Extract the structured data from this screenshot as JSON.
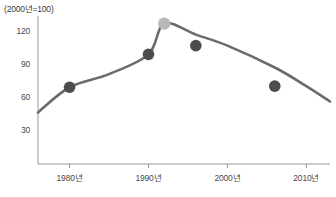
{
  "chart_data": {
    "type": "line",
    "title": "",
    "note": "(2000년=100)",
    "xlabel": "",
    "ylabel": "",
    "xlim": [
      1976,
      2013
    ],
    "ylim": [
      0,
      135
    ],
    "grid": false,
    "legend": false,
    "yticks": [
      30,
      60,
      90,
      120
    ],
    "ytick_labels": [
      "30",
      "60",
      "90",
      "120"
    ],
    "xticks": [
      1980,
      1990,
      2000,
      2010
    ],
    "xtick_labels": [
      "1980년",
      "1990년",
      "2000년",
      "2010년"
    ],
    "series": [
      {
        "name": "지수",
        "color": "#6b6b6b",
        "x": [
          1976,
          1980,
          1985,
          1990,
          1992,
          1996,
          2000,
          2006,
          2010,
          2013
        ],
        "values": [
          47,
          70,
          82,
          100,
          128,
          118,
          108,
          88,
          71,
          57
        ]
      }
    ],
    "markers": [
      {
        "x": 1980,
        "value": 70,
        "color": "#4d4d4d",
        "highlight": false
      },
      {
        "x": 1990,
        "value": 100,
        "color": "#4d4d4d",
        "highlight": false
      },
      {
        "x": 1992,
        "value": 128,
        "color": "#b8b8b8",
        "highlight": true
      },
      {
        "x": 1996,
        "value": 108,
        "color": "#4d4d4d",
        "highlight": false
      },
      {
        "x": 2006,
        "value": 71,
        "color": "#4d4d4d",
        "highlight": false
      }
    ],
    "colors": {
      "line": "#6b6b6b",
      "marker": "#4d4d4d",
      "marker_highlight": "#b8b8b8",
      "axis": "#9a9a9a",
      "text": "#4a4a4a"
    }
  }
}
